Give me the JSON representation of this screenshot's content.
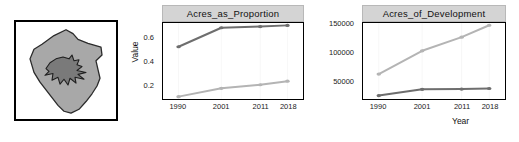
{
  "figure": {
    "axis_label_x": "Year",
    "axis_label_y": "Value"
  },
  "map": {
    "name": "county-choropleth-map",
    "county_fill": "#a8a8a8",
    "urban_fill": "#7a7a7a",
    "outline": "#2b2b2b",
    "frame": "#000000"
  },
  "colors": {
    "series_dark": "#6e6e6e",
    "series_light": "#b4b4b4",
    "strip_bg": "#d4d4d4",
    "axis": "#000000",
    "gridline": "#efefef"
  },
  "chart_data": [
    {
      "type": "line",
      "title": "Acres_as_Proportion",
      "xlabel": "Year",
      "ylabel": "Value",
      "categories": [
        "1990",
        "2001",
        "2011",
        "2018"
      ],
      "x": [
        1990,
        2001,
        2011,
        2018
      ],
      "yticks": [
        0.2,
        0.4,
        0.6
      ],
      "ylim": [
        0.08,
        0.72
      ],
      "xlim": [
        1986,
        2022
      ],
      "grid": true,
      "legend": "none",
      "series": [
        {
          "name": "series-dark",
          "color": "#6e6e6e",
          "values": [
            0.52,
            0.68,
            0.69,
            0.7
          ]
        },
        {
          "name": "series-light",
          "color": "#b4b4b4",
          "values": [
            0.1,
            0.17,
            0.2,
            0.23
          ]
        }
      ]
    },
    {
      "type": "line",
      "title": "Acres_of_Development",
      "xlabel": "Year",
      "ylabel": "Value",
      "categories": [
        "1990",
        "2001",
        "2011",
        "2018"
      ],
      "x": [
        1990,
        2001,
        2011,
        2018
      ],
      "yticks": [
        50000,
        100000,
        150000
      ],
      "ytick_labels": [
        "50000",
        "100000",
        "150000"
      ],
      "ylim": [
        18000,
        152000
      ],
      "xlim": [
        1986,
        2022
      ],
      "grid": true,
      "legend": "none",
      "series": [
        {
          "name": "series-light",
          "color": "#b4b4b4",
          "values": [
            62000,
            103000,
            127000,
            148000
          ]
        },
        {
          "name": "series-dark",
          "color": "#6e6e6e",
          "values": [
            24000,
            35000,
            35500,
            36500
          ]
        }
      ]
    }
  ]
}
